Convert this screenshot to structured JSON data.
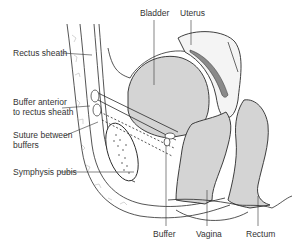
{
  "diagram": {
    "colors": {
      "organ_fill": "#d4d4d4",
      "organ_fill_dark": "#c8c8c8",
      "outline": "#2a2a2a",
      "label_text": "#333333",
      "bone_texture": "#aaaaaa",
      "uterus_cavity": "#8a8a8a"
    },
    "labels": {
      "bladder": "Bladder",
      "uterus": "Uterus",
      "rectus_sheath": "Rectus sheath",
      "buffer_anterior": "Buffer anterior\nto rectus sheath",
      "suture_between": "Suture between\nbuffers",
      "symphysis_pubis": "Symphysis pubis",
      "buffer": "Buffer",
      "vagina": "Vagina",
      "rectum": "Rectum"
    }
  }
}
